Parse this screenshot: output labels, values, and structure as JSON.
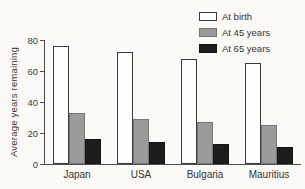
{
  "chart_data": {
    "type": "bar",
    "title": "",
    "ylabel": "Average years remaining",
    "xlabel": "",
    "categories": [
      "Japan",
      "USA",
      "Bulgaria",
      "Mauritius"
    ],
    "series": [
      {
        "name": "At birth",
        "color": "#fdfdfc",
        "border": "#3c3c3c",
        "values": [
          76,
          72,
          68,
          65
        ]
      },
      {
        "name": "At 45 years",
        "color": "#9b9b9b",
        "border": "#757575",
        "values": [
          33,
          29,
          27,
          25
        ]
      },
      {
        "name": "At 65 years",
        "color": "#1d1d1d",
        "border": "#141414",
        "values": [
          16,
          14,
          13,
          11
        ]
      }
    ],
    "ylim": [
      0,
      80
    ],
    "yticks": [
      0,
      20,
      40,
      60,
      80
    ],
    "grid": false,
    "legend_position": "top-right",
    "background": "#fbfaf7",
    "axis_color": "#4e4e4e"
  }
}
